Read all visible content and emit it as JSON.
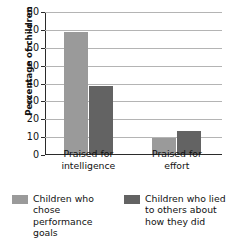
{
  "chart_data": {
    "type": "bar",
    "title": "",
    "subtitle": "",
    "xlabel": "",
    "ylabel": "Percentage of children",
    "categories": [
      "Praised for intelligence",
      "Praised for effort"
    ],
    "category_lines": [
      [
        "Praised for",
        "intelligence"
      ],
      [
        "Praised for",
        "effort"
      ]
    ],
    "series": [
      {
        "name": "Children who chose performance goals",
        "name_lines": "Children who\nchose performance\ngoals",
        "color": "#9a9a9a",
        "values": [
          68,
          9
        ]
      },
      {
        "name": "Children who lied to others about how they did",
        "name_lines": "Children who lied\nto others about\nhow they did",
        "color": "#636363",
        "values": [
          38,
          13
        ]
      }
    ],
    "ylim": [
      0,
      80
    ],
    "ytick_step": 10,
    "ytick_labels": [
      "0",
      "10",
      "20",
      "30",
      "40",
      "50",
      "60",
      "70",
      "80"
    ],
    "grid": true,
    "grid_color": "#b4b4b4",
    "axis_color": "#2b2b2b",
    "legend_position": "bottom"
  }
}
